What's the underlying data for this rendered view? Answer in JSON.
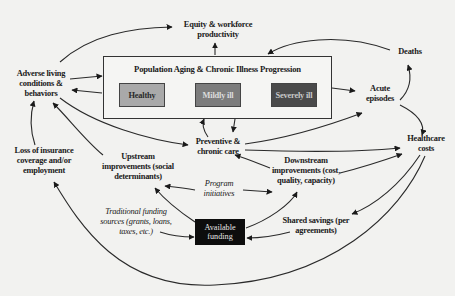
{
  "diagram": {
    "frame": {
      "title": "Population Aging & Chronic Illness Progression",
      "stages": [
        {
          "label": "Healthy",
          "color": "#a9a9a9"
        },
        {
          "label": "Mildly ill",
          "color": "#7c7c7c"
        },
        {
          "label": "Severely ill",
          "color": "#4a4a4a"
        }
      ]
    },
    "nodes": {
      "equity": {
        "line1": "Equity & workforce",
        "line2": "productivity"
      },
      "adverse": {
        "line1": "Adverse living",
        "line2": "conditions &",
        "line3": "behaviors"
      },
      "deaths": {
        "line1": "Deaths"
      },
      "acute": {
        "line1": "Acute",
        "line2": "episodes"
      },
      "healthcare_costs": {
        "line1": "Healthcare",
        "line2": "costs"
      },
      "preventive": {
        "line1": "Preventive &",
        "line2": "chronic care"
      },
      "loss_insurance": {
        "line1": "Loss of insurance",
        "line2": "coverage and/or",
        "line3": "employment"
      },
      "upstream": {
        "line1": "Upstream",
        "line2": "improvements (social",
        "line3": "determinants)"
      },
      "downstream": {
        "line1": "Downstream",
        "line2": "improvements (cost,",
        "line3": "quality, capacity)"
      },
      "program": {
        "line1": "Program",
        "line2": "initiatives"
      },
      "traditional": {
        "line1": "Traditional funding",
        "line2": "sources (grants, loans,",
        "line3": "taxes, etc.)"
      },
      "available_funding": {
        "line1": "Available",
        "line2": "funding",
        "color": "#0d0d0d"
      },
      "shared_savings": {
        "line1": "Shared savings (per",
        "line2": "agreements)"
      }
    }
  }
}
